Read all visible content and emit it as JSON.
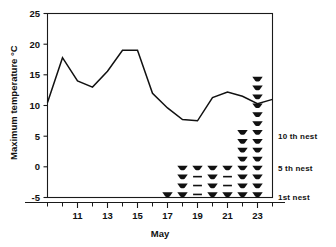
{
  "chart_data": {
    "type": "line",
    "title": "",
    "xlabel": "May",
    "ylabel": "Maximum temperature °C",
    "xlim": [
      9,
      24
    ],
    "ylim": [
      -5,
      25
    ],
    "grid": false,
    "legend_position": "right-inside",
    "x_ticks": [
      11,
      13,
      15,
      17,
      19,
      21,
      23
    ],
    "x_tick_labels": [
      "11",
      "13",
      "15",
      "17",
      "19",
      "21",
      "23"
    ],
    "x_minor_ticks": [
      10,
      12,
      14,
      16,
      18,
      20,
      22,
      24
    ],
    "y_ticks": [
      -5,
      0,
      5,
      10,
      15,
      20,
      25
    ],
    "y_tick_labels": [
      "-5",
      "0",
      "5",
      "10",
      "15",
      "20",
      "25"
    ],
    "series": [
      {
        "name": "Maximum temperature",
        "x": [
          9,
          10,
          11,
          12,
          13,
          14,
          15,
          16,
          17,
          18,
          19,
          20,
          21,
          22,
          23,
          24
        ],
        "values": [
          10.5,
          17.8,
          14.0,
          13.0,
          15.6,
          19.0,
          19.0,
          12.0,
          9.6,
          7.7,
          7.5,
          11.3,
          12.2,
          11.5,
          10.3,
          11.0
        ]
      }
    ],
    "annotations": [
      {
        "label": "10 th nest",
        "y_value": 5.0
      },
      {
        "label": "5 th nest",
        "y_value": 0.0
      },
      {
        "label": "1st nest",
        "y_value": -4.5
      }
    ],
    "nest_series": {
      "description": "Stacked nest-hatching symbols; filled trapezoid = hatched nest, dash = no record",
      "day_start_value": -4.5,
      "step": 1.45,
      "columns": [
        {
          "day": 17,
          "symbols": [
            "filled"
          ]
        },
        {
          "day": 18,
          "symbols": [
            "filled",
            "filled",
            "filled",
            "filled"
          ]
        },
        {
          "day": 19,
          "symbols": [
            "dash",
            "dash",
            "dash",
            "filled"
          ]
        },
        {
          "day": 20,
          "symbols": [
            "filled",
            "filled",
            "filled",
            "filled"
          ]
        },
        {
          "day": 21,
          "symbols": [
            "filled",
            "dash",
            "dash",
            "filled"
          ]
        },
        {
          "day": 22,
          "symbols": [
            "filled",
            "filled",
            "filled",
            "filled",
            "filled",
            "filled",
            "filled",
            "filled"
          ]
        },
        {
          "day": 23,
          "symbols": [
            "filled",
            "filled",
            "filled",
            "filled",
            "filled",
            "filled",
            "filled",
            "filled",
            "filled",
            "filled",
            "filled",
            "filled",
            "filled",
            "filled"
          ]
        }
      ]
    }
  },
  "axes": {
    "y_title": "Maximum temperature °C",
    "x_title": "May",
    "y_tick_labels": [
      "25",
      "20",
      "15",
      "10",
      "5",
      "0",
      "-5"
    ],
    "x_tick_labels": [
      "11",
      "13",
      "15",
      "17",
      "19",
      "21",
      "23"
    ]
  },
  "nest_labels": {
    "tenth": "10 th nest",
    "fifth": "5 th nest",
    "first": "1st nest"
  }
}
